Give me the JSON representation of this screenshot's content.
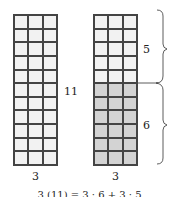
{
  "left_rectangle": {
    "rows": 11,
    "cols": 3,
    "width_label": "3",
    "height_label": "11"
  },
  "right_rectangle": {
    "rows": 11,
    "cols": 3,
    "width_label": "3",
    "upper_rows": 5,
    "lower_rows": 6,
    "upper_label": "5",
    "lower_label": "6"
  },
  "caption": "3 (11) = 3 · 6 + 3 · 5",
  "colors": {
    "unshaded": "#f2f2f2",
    "shaded": "#d3d3d3",
    "grid_line": "#444444"
  }
}
